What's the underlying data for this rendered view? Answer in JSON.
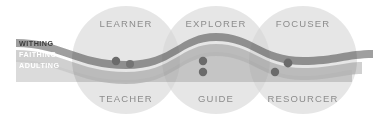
{
  "diagram": {
    "colors": {
      "background": "#ffffff",
      "circle_fill": "#d3d3d3",
      "circle_overlap": "#bcbcbc",
      "band_withing": "#9a9a9a",
      "band_faithing": "#c4c4c4",
      "band_adulting": "#d8d8d8",
      "dot": "#6b6b6b",
      "role_text": "#8c8c8c",
      "label_primary_text": "#3d3d3d",
      "label_light_text": "#ffffff"
    },
    "bands": [
      {
        "id": "withing",
        "label": "WITHING",
        "color": "#9a9a9a",
        "text_color": "#3d3d3d"
      },
      {
        "id": "faithing",
        "label": "FAITHING",
        "color": "#c4c4c4",
        "text_color": "#ffffff"
      },
      {
        "id": "adulting",
        "label": "ADULTING",
        "color": "#d8d8d8",
        "text_color": "#ffffff"
      }
    ],
    "circles": [
      {
        "id": "circle-1",
        "cx": 126,
        "cy": 60,
        "r": 54,
        "top_label": "LEARNER",
        "bottom_label": "TEACHER",
        "dots": [
          {
            "cx": 116,
            "cy": 61,
            "r": 4.2
          },
          {
            "cx": 130,
            "cy": 64,
            "r": 4.0
          }
        ]
      },
      {
        "id": "circle-2",
        "cx": 216,
        "cy": 60,
        "r": 54,
        "top_label": "EXPLORER",
        "bottom_label": "GUIDE",
        "dots": [
          {
            "cx": 203,
            "cy": 61,
            "r": 4.2
          },
          {
            "cx": 203,
            "cy": 72,
            "r": 4.2
          }
        ]
      },
      {
        "id": "circle-3",
        "cx": 303,
        "cy": 60,
        "r": 54,
        "top_label": "FOCUSER",
        "bottom_label": "RESOURCER",
        "dots": [
          {
            "cx": 288,
            "cy": 63,
            "r": 4.4
          },
          {
            "cx": 275,
            "cy": 72,
            "r": 4.2
          }
        ]
      }
    ]
  }
}
